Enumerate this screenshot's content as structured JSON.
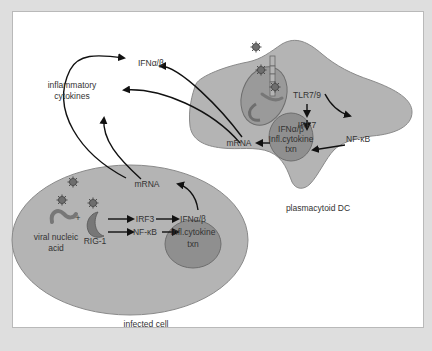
{
  "figure": {
    "infected_cell": {
      "label": "infected cell",
      "components": {
        "viral_nucleic_acid": [
          "viral nucleic",
          "acid"
        ],
        "plus": "+",
        "rig1": "RIG-1",
        "irf3": "IRF3",
        "nfkb": "NF-κB",
        "nucleus_lines": [
          "IFNα/β",
          "Infl.cytokine",
          "txn"
        ],
        "mrna": "mRNA"
      }
    },
    "plasmacytoid_dc": {
      "label": "plasmacytoid DC",
      "components": {
        "tlr": "TLR7/9",
        "irf7": "IRF7",
        "nfkb": "NF-κB",
        "nucleus_lines": [
          "IFNα/β",
          "Infl.cytokine",
          "txn"
        ],
        "mrna": "mRNA"
      }
    },
    "outputs": {
      "ifn": "IFNα/β",
      "inflammatory_cytokines": [
        "inflammatory",
        "cytokines"
      ]
    },
    "colors": {
      "cell_fill": "#b4b4b4",
      "cell_stroke": "#8a8a8a",
      "nucleus_fill": "#8f8f8f",
      "endosome_fill": "#9a9a9a",
      "panel_bg": "#ffffff",
      "page_bg": "#dedede"
    }
  }
}
